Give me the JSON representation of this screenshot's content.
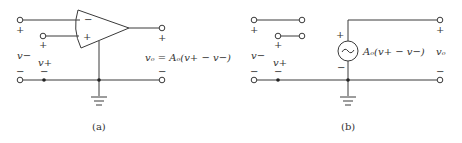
{
  "figure_a": {
    "caption": "(a)",
    "input_minus": {
      "label": "v−",
      "plus_sign": "+",
      "minus_sign": "−"
    },
    "input_plus": {
      "label": "v+",
      "plus_sign": "+",
      "minus_sign": "−"
    },
    "opamp": {
      "inverting_sign": "−",
      "noninverting_sign": "+"
    },
    "output": {
      "plus_sign": "+",
      "minus_sign": "−",
      "equation": "vₒ = Aₒ(v+ − v−)"
    }
  },
  "figure_b": {
    "caption": "(b)",
    "input_minus": {
      "label": "v−",
      "plus_sign": "+",
      "minus_sign": "−"
    },
    "input_plus": {
      "label": "v+",
      "plus_sign": "+",
      "minus_sign": "−"
    },
    "source": {
      "symbol": "~",
      "plus_sign": "+",
      "minus_sign": "−",
      "value": "Aₒ(v+ − v−)"
    },
    "output": {
      "label": "vₒ",
      "plus_sign": "+",
      "minus_sign": "−"
    }
  }
}
